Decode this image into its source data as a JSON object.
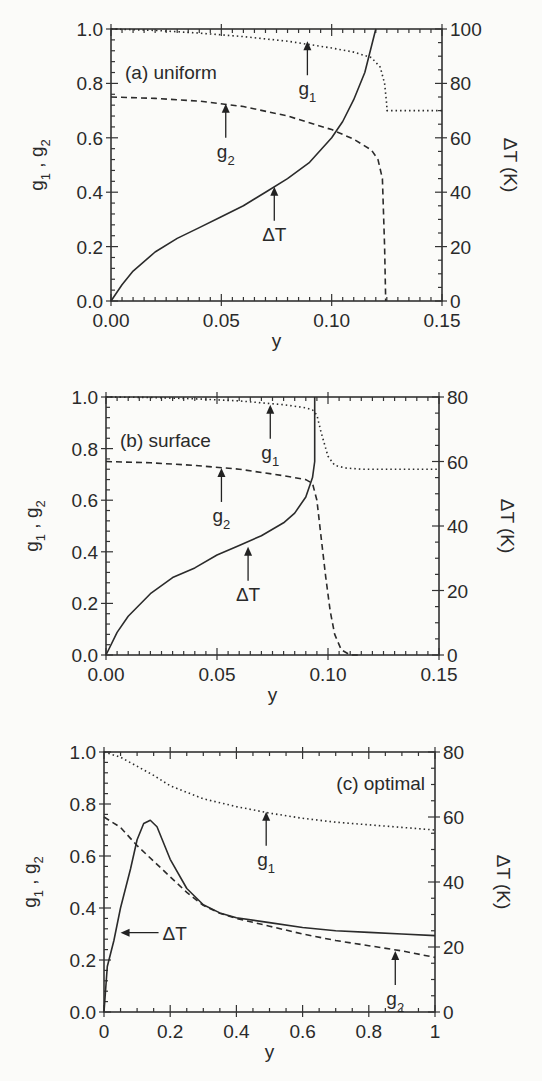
{
  "chart_data": [
    {
      "type": "line",
      "panel": "a",
      "title": "(a)  uniform",
      "xlabel": "y",
      "ylabel": "g1, g2",
      "ylabel_right": "ΔT (K)",
      "xlim": [
        0,
        0.15
      ],
      "ylim": [
        0,
        1.0
      ],
      "ylim_right": [
        0,
        100
      ],
      "xticks": [
        "0.00",
        "0.05",
        "0.10",
        "0.15"
      ],
      "yticks": [
        "0.0",
        "0.2",
        "0.4",
        "0.6",
        "0.8",
        "1.0"
      ],
      "yticks_right": [
        "0",
        "20",
        "40",
        "60",
        "80",
        "100"
      ],
      "box": {
        "left": 111,
        "right": 442,
        "top": 29,
        "bottom": 301
      },
      "series": [
        {
          "name": "g1",
          "style": "dotted",
          "axis": "left",
          "x": [
            0,
            0.02,
            0.04,
            0.06,
            0.08,
            0.1,
            0.11,
            0.118,
            0.122,
            0.124,
            0.125,
            0.125,
            0.15
          ],
          "y": [
            1.0,
            0.995,
            0.985,
            0.972,
            0.955,
            0.93,
            0.915,
            0.895,
            0.86,
            0.8,
            0.72,
            0.7,
            0.7
          ]
        },
        {
          "name": "g2",
          "style": "dashed",
          "axis": "left",
          "x": [
            0,
            0.02,
            0.04,
            0.06,
            0.08,
            0.1,
            0.11,
            0.118,
            0.121,
            0.123,
            0.124,
            0.1245
          ],
          "y": [
            0.75,
            0.745,
            0.735,
            0.715,
            0.68,
            0.63,
            0.595,
            0.555,
            0.52,
            0.45,
            0.2,
            0.0
          ]
        },
        {
          "name": "ΔT",
          "style": "solid",
          "axis": "right",
          "x": [
            0,
            0.005,
            0.01,
            0.02,
            0.03,
            0.04,
            0.05,
            0.06,
            0.07,
            0.08,
            0.09,
            0.1,
            0.105,
            0.11,
            0.115,
            0.12
          ],
          "y": [
            0,
            6,
            11,
            18,
            23,
            27,
            31,
            35,
            40,
            45,
            51,
            60,
            66,
            74,
            84,
            100
          ]
        }
      ],
      "annotations": [
        {
          "text": "g1",
          "x": 0.089,
          "y_arrow_tip": 0.955
        },
        {
          "text": "g2",
          "x": 0.052,
          "y_arrow_tip": 0.725
        },
        {
          "text": "ΔT",
          "x": 0.074,
          "y_arrow_tip": 0.42
        }
      ]
    },
    {
      "type": "line",
      "panel": "b",
      "title": "(b)  surface",
      "xlabel": "y",
      "ylabel": "g1, g2",
      "ylabel_right": "ΔT (K)",
      "xlim": [
        0,
        0.15
      ],
      "ylim": [
        0,
        1.0
      ],
      "ylim_right": [
        0,
        80
      ],
      "xticks": [
        "0.00",
        "0.05",
        "0.10",
        "0.15"
      ],
      "yticks": [
        "0.0",
        "0.2",
        "0.4",
        "0.6",
        "0.8",
        "1.0"
      ],
      "yticks_right": [
        "0",
        "20",
        "40",
        "60",
        "80"
      ],
      "box": {
        "left": 106,
        "right": 439,
        "top": 397,
        "bottom": 655
      },
      "series": [
        {
          "name": "g1",
          "style": "dotted",
          "axis": "left",
          "x": [
            0,
            0.02,
            0.04,
            0.06,
            0.08,
            0.09,
            0.093,
            0.095,
            0.097,
            0.1,
            0.103,
            0.108,
            0.115,
            0.15
          ],
          "y": [
            1.0,
            0.998,
            0.993,
            0.985,
            0.97,
            0.958,
            0.95,
            0.93,
            0.86,
            0.77,
            0.735,
            0.725,
            0.72,
            0.72
          ]
        },
        {
          "name": "g2",
          "style": "dashed",
          "axis": "left",
          "x": [
            0,
            0.02,
            0.04,
            0.06,
            0.08,
            0.09,
            0.093,
            0.095,
            0.097,
            0.099,
            0.101,
            0.103,
            0.106,
            0.11,
            0.115
          ],
          "y": [
            0.75,
            0.745,
            0.735,
            0.72,
            0.695,
            0.68,
            0.665,
            0.6,
            0.45,
            0.3,
            0.17,
            0.08,
            0.02,
            0.0,
            0.0
          ]
        },
        {
          "name": "ΔT",
          "style": "solid",
          "axis": "right",
          "x": [
            0,
            0.005,
            0.01,
            0.02,
            0.03,
            0.04,
            0.05,
            0.06,
            0.07,
            0.08,
            0.085,
            0.09,
            0.093,
            0.094,
            0.094
          ],
          "y": [
            0,
            7,
            12,
            19,
            24,
            27,
            31,
            34,
            37,
            41,
            44,
            49,
            55,
            60,
            80
          ]
        }
      ],
      "annotations": [
        {
          "text": "g1",
          "x": 0.074,
          "y_arrow_tip": 0.97
        },
        {
          "text": "g2",
          "x": 0.052,
          "y_arrow_tip": 0.725
        },
        {
          "text": "ΔT",
          "x": 0.064,
          "y_arrow_tip": 0.42
        }
      ]
    },
    {
      "type": "line",
      "panel": "c",
      "title": "(c)  optimal",
      "xlabel": "y",
      "ylabel": "g1, g2",
      "ylabel_right": "ΔT (K)",
      "xlim": [
        0,
        1
      ],
      "ylim": [
        0,
        1.0
      ],
      "ylim_right": [
        0,
        80
      ],
      "xticks": [
        "0",
        "0.2",
        "0.4",
        "0.6",
        "0.8",
        "1"
      ],
      "yticks": [
        "0.0",
        "0.2",
        "0.4",
        "0.6",
        "0.8",
        "1.0"
      ],
      "yticks_right": [
        "0",
        "20",
        "40",
        "60",
        "80"
      ],
      "box": {
        "left": 104,
        "right": 435,
        "top": 752,
        "bottom": 1012
      },
      "series": [
        {
          "name": "g1",
          "style": "dotted",
          "axis": "left",
          "x": [
            0,
            0.05,
            0.1,
            0.15,
            0.2,
            0.3,
            0.4,
            0.5,
            0.6,
            0.7,
            0.8,
            0.9,
            1.0
          ],
          "y": [
            1.0,
            0.98,
            0.945,
            0.91,
            0.87,
            0.82,
            0.79,
            0.765,
            0.745,
            0.73,
            0.72,
            0.71,
            0.7
          ]
        },
        {
          "name": "g2",
          "style": "dashed",
          "axis": "left",
          "x": [
            0,
            0.05,
            0.1,
            0.15,
            0.2,
            0.25,
            0.3,
            0.35,
            0.4,
            0.5,
            0.6,
            0.7,
            0.8,
            0.9,
            1.0
          ],
          "y": [
            0.75,
            0.71,
            0.64,
            0.58,
            0.52,
            0.46,
            0.41,
            0.38,
            0.36,
            0.33,
            0.3,
            0.275,
            0.255,
            0.235,
            0.21
          ]
        },
        {
          "name": "ΔT",
          "style": "solid",
          "axis": "right",
          "x": [
            0,
            0.01,
            0.03,
            0.05,
            0.08,
            0.1,
            0.12,
            0.14,
            0.16,
            0.2,
            0.25,
            0.3,
            0.35,
            0.4,
            0.5,
            0.6,
            0.7,
            0.8,
            0.9,
            1.0
          ],
          "y": [
            0,
            14,
            22,
            32,
            44,
            53,
            58,
            59,
            57,
            47,
            38,
            33,
            30.5,
            29,
            27.5,
            26,
            25,
            24.5,
            24,
            23.5
          ]
        }
      ],
      "annotations": [
        {
          "text": "g1",
          "x": 0.49,
          "y_arrow_tip": 0.77
        },
        {
          "text": "g2",
          "x": 0.88,
          "y_arrow_tip": 0.235
        },
        {
          "text": "ΔT",
          "x": 0.05,
          "y_arrow_tip": 0.305,
          "direction": "left"
        }
      ]
    }
  ]
}
